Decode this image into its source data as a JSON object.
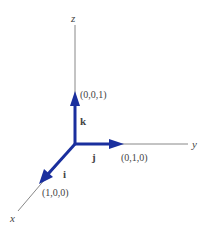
{
  "diagram": {
    "axes": {
      "x": "x",
      "y": "y",
      "z": "z"
    },
    "vectors": [
      {
        "name": "i",
        "point": "(1,0,0)"
      },
      {
        "name": "j",
        "point": "(0,1,0)"
      },
      {
        "name": "k",
        "point": "(0,0,1)"
      }
    ],
    "colors": {
      "axis": "#888888",
      "vector": "#1a2f9e"
    }
  }
}
